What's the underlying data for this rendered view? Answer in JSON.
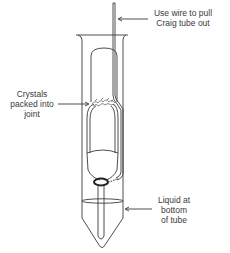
{
  "diagram": {
    "labels": {
      "wire": [
        "Use wire to pull",
        "Craig tube out"
      ],
      "crystals": [
        "Crystals",
        "packed into",
        "joint"
      ],
      "liquid": [
        "Liquid at",
        "bottom",
        "of tube"
      ]
    },
    "components": [
      "outer-tube",
      "inner-plug",
      "wire",
      "crystals",
      "liquid"
    ],
    "colors": {
      "line": "#3a3a3a",
      "background": "#ffffff"
    }
  }
}
